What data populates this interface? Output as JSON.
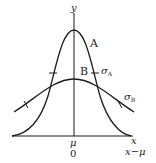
{
  "diagram": {
    "type": "normal-distribution-comparison",
    "axes": {
      "y_label": "y",
      "x_label": "x",
      "x_label_alt": "x−μ",
      "center_tick_label": "μ",
      "center_tick_label_alt": "0"
    },
    "curves": [
      {
        "name": "A",
        "label": "A",
        "sigma_label_base": "σ",
        "sigma_label_sub": "A",
        "shape": "tall, narrow (small σ)"
      },
      {
        "name": "B",
        "label": "B",
        "sigma_label_base": "σ",
        "sigma_label_sub": "B",
        "shape": "short, wide (large σ)"
      }
    ],
    "colors": {
      "stroke": "#1a1a1a",
      "background": "#ffffff"
    }
  }
}
